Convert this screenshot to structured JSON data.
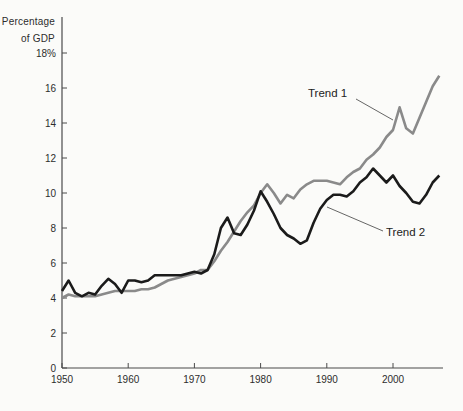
{
  "figure": {
    "unit_label": [
      "Percentage",
      "of GDP"
    ]
  },
  "chart_data": {
    "type": "line",
    "title": "",
    "xlabel": "",
    "ylabel": "Percentage of GDP",
    "xlim": [
      1950,
      2008
    ],
    "ylim": [
      0,
      19.5
    ],
    "grid": false,
    "legend_position": "inline-annotations",
    "x_ticks": [
      1950,
      1960,
      1970,
      1980,
      1990,
      2000
    ],
    "y_ticks": [
      0,
      2,
      4,
      6,
      8,
      10,
      12,
      14,
      16,
      18
    ],
    "y_tick_labels": [
      "0",
      "2",
      "4",
      "6",
      "8",
      "10",
      "12",
      "14",
      "16",
      "18%"
    ],
    "years": [
      1950,
      1951,
      1952,
      1953,
      1954,
      1955,
      1956,
      1957,
      1958,
      1959,
      1960,
      1961,
      1962,
      1963,
      1964,
      1965,
      1966,
      1967,
      1968,
      1969,
      1970,
      1971,
      1972,
      1973,
      1974,
      1975,
      1976,
      1977,
      1978,
      1979,
      1980,
      1981,
      1982,
      1983,
      1984,
      1985,
      1986,
      1987,
      1988,
      1989,
      1990,
      1991,
      1992,
      1993,
      1994,
      1995,
      1996,
      1997,
      1998,
      1999,
      2000,
      2001,
      2002,
      2003,
      2004,
      2005,
      2006,
      2007
    ],
    "series": [
      {
        "name": "Trend 1",
        "color": "#8a8a8a",
        "values": [
          4.0,
          4.2,
          4.1,
          4.1,
          4.1,
          4.1,
          4.2,
          4.3,
          4.4,
          4.4,
          4.4,
          4.4,
          4.5,
          4.5,
          4.6,
          4.8,
          5.0,
          5.1,
          5.2,
          5.3,
          5.4,
          5.6,
          5.6,
          6.1,
          6.7,
          7.2,
          7.8,
          8.4,
          8.9,
          9.3,
          10.0,
          10.5,
          10.0,
          9.4,
          9.9,
          9.7,
          10.2,
          10.5,
          10.7,
          10.7,
          10.7,
          10.6,
          10.5,
          10.9,
          11.2,
          11.4,
          11.9,
          12.2,
          12.6,
          13.2,
          13.6,
          14.9,
          13.7,
          13.4,
          14.3,
          15.2,
          16.1,
          16.7
        ]
      },
      {
        "name": "Trend 2",
        "color": "#1b1b1b",
        "values": [
          4.4,
          5.0,
          4.3,
          4.1,
          4.3,
          4.2,
          4.7,
          5.1,
          4.8,
          4.3,
          5.0,
          5.0,
          4.9,
          5.0,
          5.3,
          5.3,
          5.3,
          5.3,
          5.3,
          5.4,
          5.5,
          5.4,
          5.6,
          6.5,
          8.0,
          8.6,
          7.7,
          7.6,
          8.2,
          9.0,
          10.1,
          9.5,
          8.8,
          8.0,
          7.6,
          7.4,
          7.1,
          7.3,
          8.3,
          9.1,
          9.6,
          9.9,
          9.9,
          9.8,
          10.1,
          10.6,
          10.9,
          11.4,
          11.0,
          10.6,
          11.0,
          10.4,
          10.0,
          9.5,
          9.4,
          9.9,
          10.6,
          11.0
        ]
      }
    ],
    "annotations": [
      {
        "label": "Trend 1",
        "label_px": {
          "left": 308,
          "top": 87
        },
        "callout_px": {
          "x1": 356,
          "y1": 99,
          "x2": 393,
          "y2": 120
        },
        "points_to": {
          "year": 2000,
          "value": 14.2
        }
      },
      {
        "label": "Trend 2",
        "label_px": {
          "left": 386,
          "top": 226
        },
        "callout_px": {
          "x1": 383,
          "y1": 231,
          "x2": 327,
          "y2": 207
        },
        "points_to": {
          "year": 1990,
          "value": 9.2
        }
      }
    ],
    "axis_color": "#4a4a4a",
    "tick_label_color": "#2d2d2d"
  }
}
